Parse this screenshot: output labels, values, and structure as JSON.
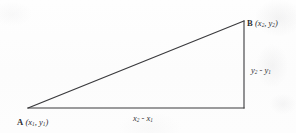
{
  "figure": {
    "type": "geometry-diagram",
    "shape": "right-triangle",
    "background_color": "#fdfdfd",
    "line_color": "#3a3a3d",
    "text_color": "#2e2e31"
  },
  "vertices": {
    "a": {
      "name": "A",
      "coords_open": "(",
      "coords_x": "x",
      "coords_x_sub": "1",
      "coords_sep": ", ",
      "coords_y": "y",
      "coords_y_sub": "1",
      "coords_close": ")",
      "px": 28,
      "py": 108
    },
    "b": {
      "name": "B",
      "coords_open": "(",
      "coords_x": "x",
      "coords_x_sub": "2",
      "coords_sep": ", ",
      "coords_y": "y",
      "coords_y_sub": "2",
      "coords_close": ")",
      "px": 244,
      "py": 21
    },
    "right_angle": {
      "name": "C",
      "px": 244,
      "py": 108
    }
  },
  "legs": {
    "horizontal": {
      "term1": "x",
      "term1_sub": "2",
      "operator": " - ",
      "term2": "x",
      "term2_sub": "1"
    },
    "vertical": {
      "term1": "y",
      "term1_sub": "2",
      "operator": " - ",
      "term2": "y",
      "term2_sub": "1"
    }
  },
  "geometry": {
    "hypotenuse": "M 28 108 L 244 21",
    "leg_bottom": "M 28 108 L 244 108",
    "leg_right": "M 244 21 L 244 108",
    "stroke_width": 1.1
  }
}
